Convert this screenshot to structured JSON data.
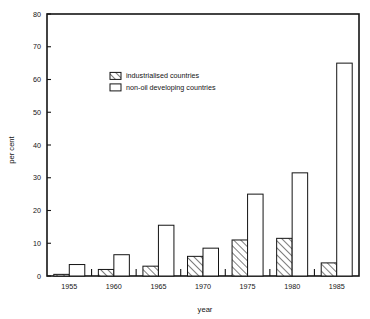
{
  "chart_data": {
    "type": "bar",
    "title": "",
    "subtitle": "",
    "xlabel": "year",
    "ylabel": "per cent",
    "categories": [
      "1955",
      "1960",
      "1965",
      "1970",
      "1975",
      "1980",
      "1985"
    ],
    "series": [
      {
        "name": "industrialised countries",
        "style": "hatched",
        "values": [
          0.5,
          2,
          3,
          6,
          11,
          11.5,
          4
        ]
      },
      {
        "name": "non-oil developing countries",
        "style": "open",
        "values": [
          3.5,
          6.5,
          15.5,
          8.5,
          25,
          31.5,
          65
        ]
      }
    ],
    "ylim": [
      0,
      80
    ],
    "yticks": [
      0,
      10,
      20,
      30,
      40,
      50,
      60,
      70,
      80
    ],
    "ytick_labels": [
      "0",
      "10",
      "20",
      "30",
      "40",
      "50",
      "60",
      "70",
      "80"
    ],
    "xtick_labels": [
      "1955",
      "1960",
      "1965",
      "1970",
      "1975",
      "1980",
      "1985"
    ],
    "grid": false,
    "legend_position": "upper-center-left",
    "frame": "box"
  },
  "legend": {
    "items": [
      {
        "label": "industrialised countries",
        "swatch": "hatched-swatch"
      },
      {
        "label": "non-oil developing countries",
        "swatch": "open-swatch"
      }
    ]
  },
  "axes": {
    "y_title": "per cent",
    "x_title": "year"
  },
  "colors": {
    "ink": "#141414",
    "background": "#ffffff"
  }
}
